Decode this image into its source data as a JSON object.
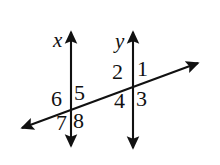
{
  "figure": {
    "kind": "geometry-diagram",
    "background_color": "#ffffff",
    "stroke_color": "#111111",
    "text_color": "#111111"
  },
  "lines": [
    {
      "id": "line-x",
      "name": "x",
      "orientation": "vertical",
      "arrowheads": "both",
      "x": 71,
      "y_top": 28,
      "y_bottom": 150
    },
    {
      "id": "line-y",
      "name": "y",
      "orientation": "vertical",
      "arrowheads": "both",
      "x": 133,
      "y_top": 28,
      "y_bottom": 150
    },
    {
      "id": "transversal",
      "name": "",
      "orientation": "diagonal",
      "arrowheads": "both",
      "x1": 18,
      "y1": 130,
      "x2": 202,
      "y2": 61
    }
  ],
  "line_labels": [
    {
      "id": "label-x",
      "text": "x",
      "x": 53,
      "y": 30
    },
    {
      "id": "label-y",
      "text": "y",
      "x": 115,
      "y": 31
    }
  ],
  "intersections": [
    {
      "id": "intersection-x",
      "line": "x",
      "x": 71,
      "y": 111
    },
    {
      "id": "intersection-y",
      "line": "y",
      "x": 133,
      "y": 88
    }
  ],
  "angles": [
    {
      "id": "angle-1",
      "label": "1",
      "at_line": "y",
      "position": "upper-right",
      "x": 137,
      "y": 58
    },
    {
      "id": "angle-2",
      "label": "2",
      "at_line": "y",
      "position": "upper-left",
      "x": 112,
      "y": 61
    },
    {
      "id": "angle-3",
      "label": "3",
      "at_line": "y",
      "position": "lower-right",
      "x": 136,
      "y": 88
    },
    {
      "id": "angle-4",
      "label": "4",
      "at_line": "y",
      "position": "lower-left",
      "x": 114,
      "y": 90
    },
    {
      "id": "angle-5",
      "label": "5",
      "at_line": "x",
      "position": "upper-right",
      "x": 74,
      "y": 82
    },
    {
      "id": "angle-6",
      "label": "6",
      "at_line": "x",
      "position": "upper-left",
      "x": 51,
      "y": 88
    },
    {
      "id": "angle-7",
      "label": "7",
      "at_line": "x",
      "position": "lower-left",
      "x": 56,
      "y": 112
    },
    {
      "id": "angle-8",
      "label": "8",
      "at_line": "x",
      "position": "lower-right",
      "x": 73,
      "y": 110
    }
  ]
}
